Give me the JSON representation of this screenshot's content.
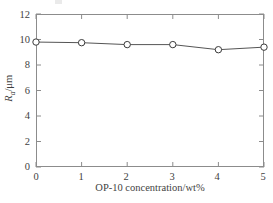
{
  "chart_data": {
    "type": "line",
    "title": "",
    "subtitle": "",
    "xlabel": "OP-10 concentration/wt%",
    "ylabel": "Ra/μm",
    "ylabel_parts": {
      "symbol": "R",
      "subscript": "a",
      "unit": "/μm"
    },
    "x": [
      0,
      1,
      2,
      3,
      4,
      5
    ],
    "values": [
      9.8,
      9.75,
      9.6,
      9.6,
      9.2,
      9.4
    ],
    "series": [
      {
        "name": "Ra",
        "values": [
          9.8,
          9.75,
          9.6,
          9.6,
          9.2,
          9.4
        ]
      }
    ],
    "xlim": [
      0,
      5
    ],
    "ylim": [
      0,
      12
    ],
    "xticks": [
      0,
      1,
      2,
      3,
      4,
      5
    ],
    "xtick_labels": [
      "0",
      "1",
      "2",
      "3",
      "4",
      "5"
    ],
    "yticks": [
      0,
      2,
      4,
      6,
      8,
      10,
      12
    ],
    "ytick_labels": [
      "0",
      "2",
      "4",
      "6",
      "8",
      "10",
      "12"
    ],
    "grid": false,
    "legend": false,
    "legend_position": "none",
    "marker": "open-circle",
    "line_color": "#555555",
    "marker_edge_color": "#3a3a3a",
    "marker_face_color": "#ffffff",
    "frame_color": "#8c8c8c",
    "tick_direction": "in"
  },
  "axes": {
    "x_title": "OP-10 concentration/wt%",
    "y_title_symbol": "R",
    "y_title_subscript": "a",
    "y_title_unit": "/μm"
  }
}
